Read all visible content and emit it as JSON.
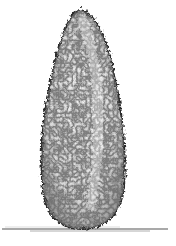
{
  "image": {
    "subject": "pencil sketch of a conical topiary shrub",
    "colors": {
      "background": "#ffffff",
      "ink": "#2a2a2a",
      "shade": "#5a5a5a",
      "highlight": "#f2f2f2"
    }
  }
}
